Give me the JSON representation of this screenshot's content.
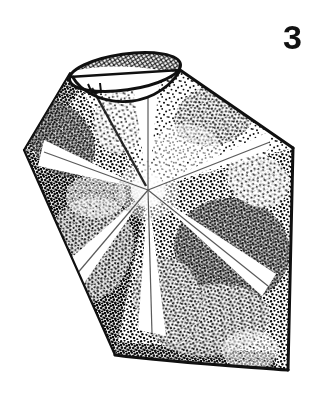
{
  "figure": {
    "label": "3",
    "caption_text": "",
    "medium": "stipple line drawing",
    "background_color": "#ffffff",
    "ink_color": "#101010",
    "canvas": {
      "width": 323,
      "height": 409
    }
  },
  "geometry": {
    "body_outline_points": "70,73 180,70 293,148 288,370 115,355 24,150",
    "apex_ellipse": {
      "cx": 125,
      "cy": 72,
      "rx": 56,
      "ry": 18,
      "rotation_deg": -8,
      "hatch_fill": "cross-hatch",
      "rim_inner_arc": "M 72,74 C 88,104 150,110 180,71"
    },
    "right_edge": "M 293,148 L 288,370",
    "upper_right_edge": "M 180,70 L 293,148",
    "lower_right_edge": "M 288,370 L 115,355",
    "left_upper_edge": "M 70,73 L 24,150",
    "left_lower_edge": "M 24,150 L 115,355",
    "radial_center": {
      "x": 148,
      "y": 190
    },
    "ray_count": 6,
    "ray_angles_deg": [
      95,
      150,
      205,
      255,
      300,
      20
    ]
  },
  "shading": {
    "zones": [
      {
        "name": "upper-left-facet",
        "density": "medium-dark"
      },
      {
        "name": "upper-right-facet",
        "density": "medium"
      },
      {
        "name": "left-facet",
        "density": "dark"
      },
      {
        "name": "lower-left-facet",
        "density": "dark"
      },
      {
        "name": "lower-right-facet",
        "density": "dark"
      },
      {
        "name": "right-facet",
        "density": "medium-dark"
      }
    ],
    "highlight_rays": "white unstippled rays radiating from center"
  },
  "toolbar": {
    "zoom_label": "100%"
  }
}
